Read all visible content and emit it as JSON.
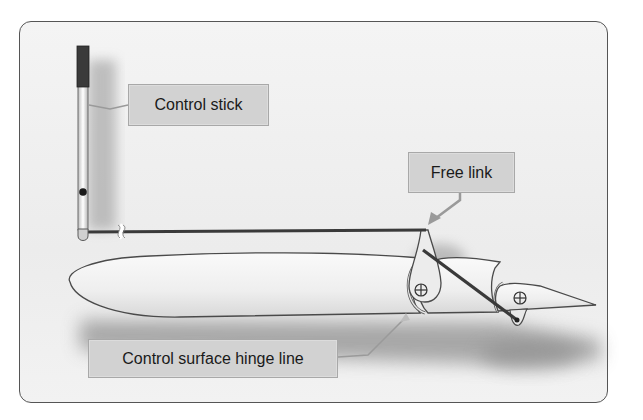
{
  "diagram": {
    "labels": {
      "control_stick": "Control stick",
      "free_link": "Free link",
      "hinge_line": "Control surface hinge line"
    },
    "colors": {
      "panel_border": "#555555",
      "panel_bg": "#eeeeee",
      "label_bg": "#d2d2d2",
      "label_border": "#a8a8a8",
      "rod": "#3a3a3a",
      "airfoil_fill": "#f3f3f3",
      "airfoil_stroke": "#4a4a4a",
      "shadow": "#9a9a9a"
    },
    "components": [
      "control-stick",
      "push-rod",
      "break-symbol",
      "airfoil-main",
      "control-surface",
      "bellcrank",
      "free-link-rod",
      "trailing-tab",
      "hinge-pivot-1",
      "hinge-pivot-2"
    ]
  }
}
